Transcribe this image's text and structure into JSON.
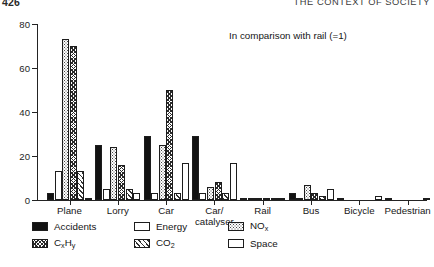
{
  "running_head": {
    "folio": "426",
    "title": "THE CONTEXT OF SOCIETY"
  },
  "annotation": "In comparison with rail (=1)",
  "axis": {
    "y_ticks": [
      "0",
      "20",
      "40",
      "60",
      "80"
    ],
    "y_label": "",
    "x_label": ""
  },
  "legend": {
    "columns": [
      [
        {
          "label": "Accidents",
          "key": "accidents",
          "swatch": "solid-black"
        },
        {
          "label": "CxHy",
          "key": "cxhy",
          "swatch": "dark-crosshatch",
          "html": "C<sub>x</sub>H<sub>y</sub>"
        }
      ],
      [
        {
          "label": "Energy",
          "key": "energy",
          "swatch": "white"
        },
        {
          "label": "CO2",
          "key": "co2",
          "swatch": "diagonal-hatch",
          "html": "CO<sub>2</sub>"
        }
      ],
      [
        {
          "label": "NOx",
          "key": "nox",
          "swatch": "stipple",
          "html": "NO<sub>x</sub>"
        },
        {
          "label": "Space",
          "key": "space",
          "swatch": "white"
        }
      ]
    ]
  },
  "chart_data": {
    "type": "bar",
    "title": "",
    "subtitle": "",
    "annotation": "In comparison with rail (=1)",
    "xlabel": "",
    "ylabel": "",
    "ylim": [
      0,
      80
    ],
    "yticks": [
      0,
      20,
      40,
      60,
      80
    ],
    "grid": false,
    "legend_position": "below-axes",
    "categories": [
      "Plane",
      "Lorry",
      "Car",
      "Car/catalyser",
      "Rail",
      "Bus",
      "Bicycle",
      "Pedestrian"
    ],
    "series": [
      {
        "name": "Accidents",
        "pattern": "solid-black",
        "values": [
          3,
          25,
          29,
          29,
          1,
          3,
          1,
          0.5
        ]
      },
      {
        "name": "Energy",
        "pattern": "white",
        "values": [
          13,
          5,
          3,
          3,
          1,
          1,
          0,
          0
        ]
      },
      {
        "name": "NOx",
        "pattern": "stipple",
        "values": [
          73,
          24,
          25,
          6,
          1,
          7,
          0,
          0
        ]
      },
      {
        "name": "CxHy",
        "pattern": "dark-crosshatch",
        "values": [
          70,
          16,
          50,
          8,
          1,
          3,
          0,
          0
        ]
      },
      {
        "name": "CO2",
        "pattern": "diagonal-hatch",
        "values": [
          13,
          5,
          3,
          3,
          1,
          2,
          0,
          0
        ]
      },
      {
        "name": "Space",
        "pattern": "white-outline",
        "values": [
          1,
          3,
          17,
          17,
          1,
          5,
          2,
          1
        ]
      }
    ]
  }
}
